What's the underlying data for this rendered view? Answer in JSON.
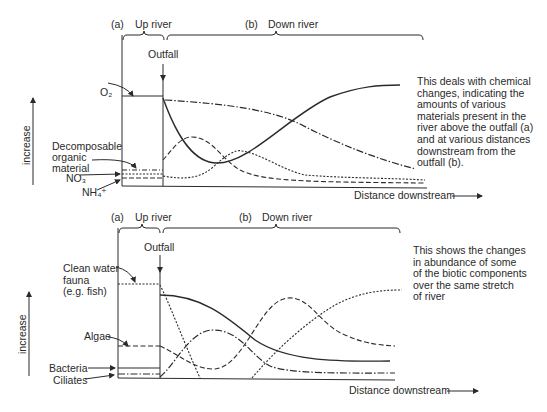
{
  "top_panel": {
    "region_a": "(a)",
    "region_a_label": "Up river",
    "region_b": "(b)",
    "region_b_label": "Down river",
    "outfall": "Outfall",
    "y_axis_label": "increase",
    "x_axis_label": "Distance downstream",
    "labels": {
      "o2": "O₂",
      "decomposable": "Decomposable\norganic\nmaterial",
      "no3": "NO₃",
      "nh4": "NH₄⁺"
    },
    "note": "This deals with chemical\nchanges, indicating the\namounts of various\nmaterials present in the\nriver above the outfall (a)\nand at various distances\ndownstream from the\noutfall (b)."
  },
  "bottom_panel": {
    "region_a": "(a)",
    "region_a_label": "Up river",
    "region_b": "(b)",
    "region_b_label": "Down river",
    "outfall": "Outfall",
    "y_axis_label": "increase",
    "x_axis_label": "Distance downstream",
    "labels": {
      "fauna": "Clean water\nfauna\n(e.g. fish)",
      "algae": "Algae",
      "bacteria": "Bacteria",
      "ciliates": "Ciliates"
    },
    "note": "This shows the changes\nin abundance of some\nof the biotic components\nover the same stretch\nof river"
  },
  "colors": {
    "ink": "#2a2a2a",
    "background": "#ffffff"
  }
}
